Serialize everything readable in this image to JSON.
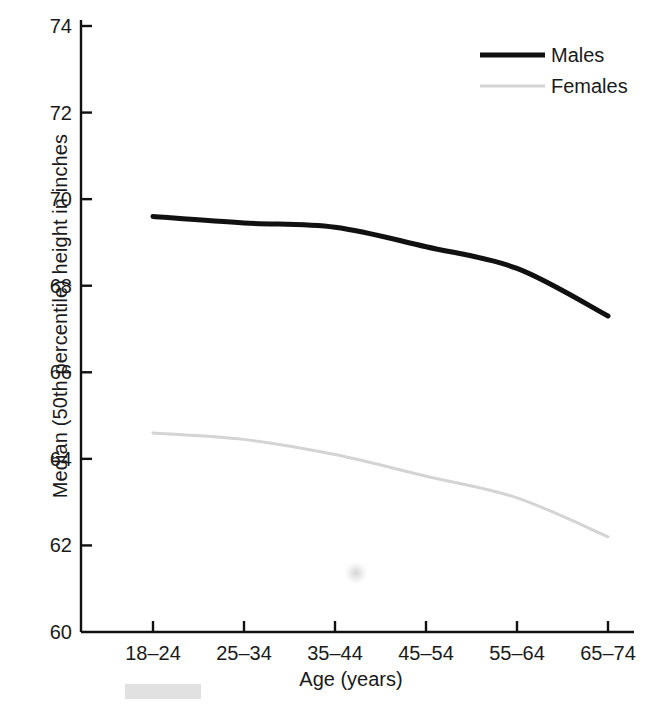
{
  "chart_data": {
    "type": "line",
    "title": "",
    "xlabel": "Age (years)",
    "ylabel": "Median (50th percentile) height in inches",
    "categories": [
      "18–24",
      "25–34",
      "35–44",
      "45–54",
      "55–64",
      "65–74"
    ],
    "series": [
      {
        "name": "Males",
        "values": [
          69.6,
          69.45,
          69.35,
          68.9,
          68.4,
          67.3
        ],
        "color": "#111111",
        "line_width": 5
      },
      {
        "name": "Females",
        "values": [
          64.6,
          64.45,
          64.1,
          63.6,
          63.1,
          62.2
        ],
        "color": "#d4d4d4",
        "line_width": 3
      }
    ],
    "ylim": [
      60,
      74
    ],
    "xlim_categories": 6,
    "yticks": [
      60,
      62,
      64,
      66,
      68,
      70,
      72,
      74
    ],
    "ytick_labels": [
      "60",
      "62",
      "64",
      "66",
      "68",
      "70",
      "72",
      "74"
    ],
    "grid": false,
    "legend_position": "top-right",
    "axis_color": "#111111"
  },
  "axes": {
    "y_title": "Median (50th percentile) height in inches",
    "x_title": "Age (years)"
  },
  "legend": {
    "entries": [
      {
        "label": "Males"
      },
      {
        "label": "Females"
      }
    ]
  }
}
